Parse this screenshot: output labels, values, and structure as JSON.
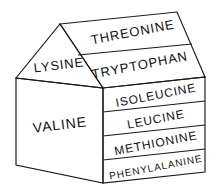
{
  "diagram": {
    "type": "isometric-house-diagram",
    "stroke_color": "#1a1a1a",
    "fill_color": "#ffffff",
    "text_color": "#111111",
    "faces": {
      "roof_back_panel": {
        "name": "roof-panel-threonine",
        "label": "THREONINE",
        "font_size": 13,
        "rotation": -11
      },
      "roof_front_panel": {
        "name": "roof-panel-tryptophan",
        "label": "TRYPTOPHAN",
        "font_size": 13,
        "rotation": -11
      },
      "gable": {
        "name": "gable-lysine",
        "label": "LYSINE",
        "font_size": 13,
        "rotation": -7
      },
      "left_wall": {
        "name": "wall-valine",
        "label": "VALINE",
        "font_size": 14,
        "rotation": -7
      }
    },
    "right_wall_rows": [
      {
        "name": "row-isoleucine",
        "label": "ISOLEUCINE",
        "font_size": 12,
        "rotation": -11
      },
      {
        "name": "row-leucine",
        "label": "LEUCINE",
        "font_size": 12,
        "rotation": -11
      },
      {
        "name": "row-methionine",
        "label": "METHIONINE",
        "font_size": 12,
        "rotation": -11
      },
      {
        "name": "row-phenylalanine",
        "label": "PHENYLALANINE",
        "font_size": 10,
        "rotation": -11
      }
    ]
  }
}
